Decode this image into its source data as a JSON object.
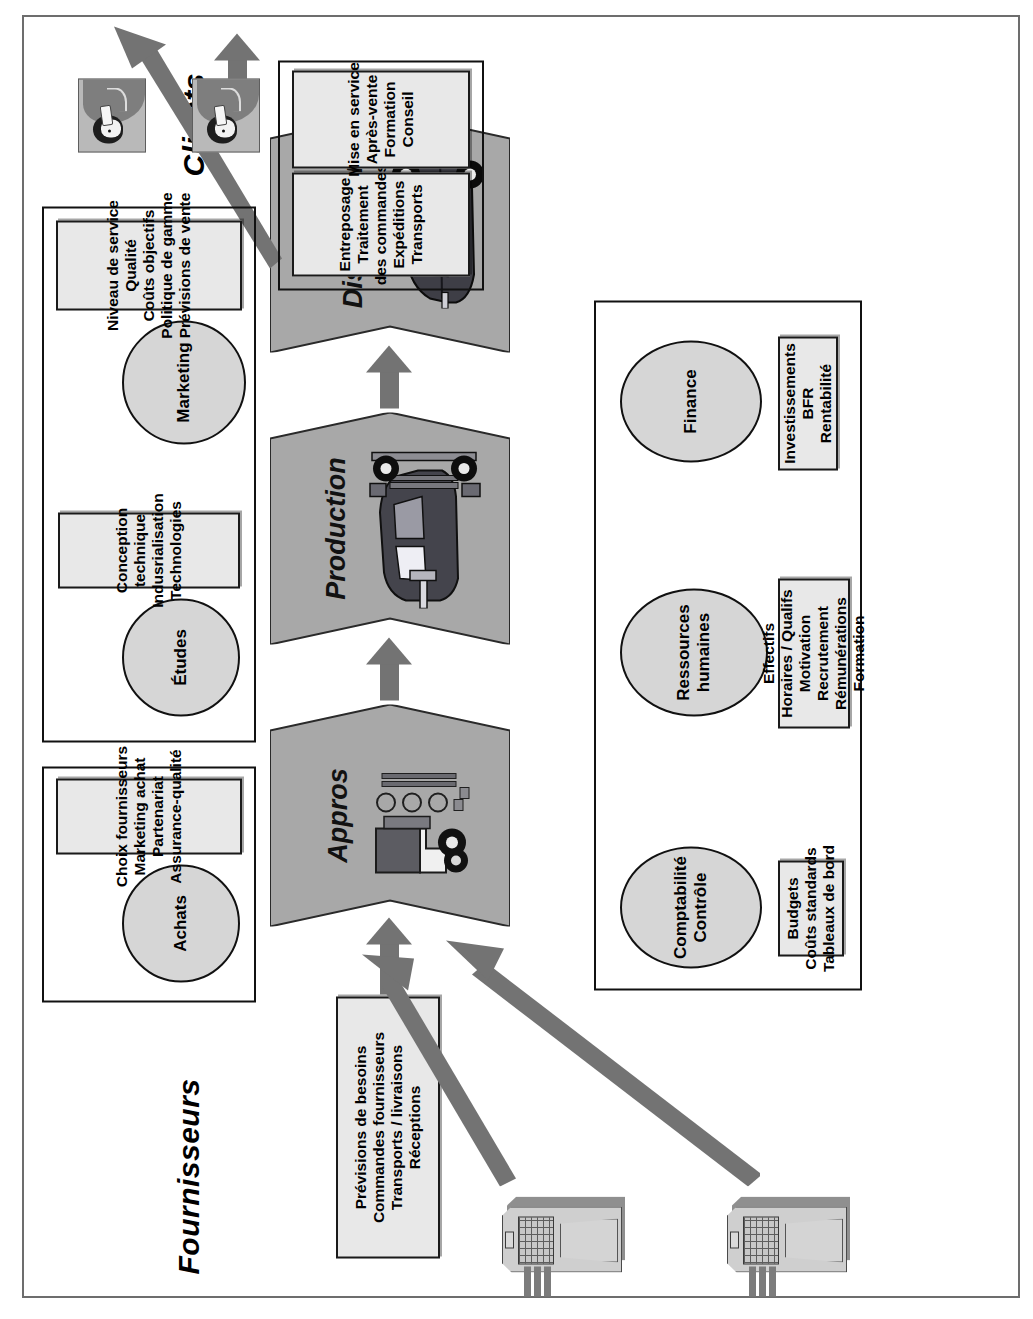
{
  "diagram": {
    "title_left": "Fournisseurs",
    "title_right": "Clients",
    "process_chain": [
      {
        "id": "appros",
        "label": "Appros",
        "icon": "truck-parts-icon"
      },
      {
        "id": "production",
        "label": "Production",
        "icon": "car-assembly-icon"
      },
      {
        "id": "ventes",
        "label": "Ventes\nDistribution",
        "icon": "car-finished-icon"
      }
    ],
    "supplier_box": {
      "name": "fournisseurs-activities",
      "lines": [
        "Prévisions de besoins",
        "Commandes fournisseurs",
        "Transports / livraisons",
        "Réceptions"
      ]
    },
    "client_boxes": [
      {
        "name": "distribution-activities",
        "lines": [
          "Entreposage",
          "Traitement",
          "des commandes",
          "Expéditions",
          "Transports"
        ]
      },
      {
        "name": "after-sales-activities",
        "lines": [
          "Mise en service",
          "Après-vente",
          "Formation",
          "Conseil"
        ]
      }
    ],
    "upper_functions": [
      {
        "id": "achats",
        "ellipse": "Achats",
        "box_lines": [
          "Choix fournisseurs",
          "Marketing achat",
          "Partenariat",
          "Assurance-qualité"
        ]
      },
      {
        "id": "etudes",
        "ellipse": "Études",
        "box_lines": [
          "Conception",
          "technique",
          "Indusrialisation",
          "Technologies"
        ]
      },
      {
        "id": "marketing",
        "ellipse": "Marketing",
        "box_lines": [
          "Niveau de service",
          "Qualité",
          "Coûts objectifs",
          "Politique de gamme",
          "Prévisions de vente"
        ]
      }
    ],
    "lower_functions": [
      {
        "id": "comptabilite",
        "ellipse": "Comptabilité\nContrôle",
        "box_lines": [
          "Budgets",
          "Coûts standards",
          "Tableaux de bord"
        ]
      },
      {
        "id": "ressources-humaines",
        "ellipse": "Ressources\nhumaines",
        "box_lines": [
          "Effectifs",
          "Horaires / Qualifs",
          "Motivation",
          "Recrutement",
          "Rémunérations",
          "Formation"
        ]
      },
      {
        "id": "finance",
        "ellipse": "Finance",
        "box_lines": [
          "Investissements",
          "BFR",
          "Rentabilité"
        ]
      }
    ],
    "colors": {
      "chevron_fill": "#a8a8a8",
      "box_fill": "#e8e8e8",
      "ellipse_fill": "#d6d6d6",
      "arrow": "#737373",
      "outline": "#111111",
      "frame": "#6d6d6d"
    }
  }
}
